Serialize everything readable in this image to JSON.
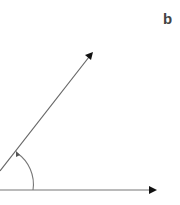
{
  "panel_label": "b",
  "diagram": {
    "type": "angle",
    "vertex": [
      -5,
      190
    ],
    "rays": [
      {
        "name": "horizontal-ray",
        "end": [
          157,
          190
        ],
        "arrowhead": true
      },
      {
        "name": "diagonal-ray",
        "end": [
          93,
          52
        ],
        "arrowhead": true
      }
    ],
    "angle_arc": {
      "radius": 38,
      "direction": "counterclockwise",
      "arrowhead_at": "diagonal-ray"
    }
  },
  "colors": {
    "line": "#666666",
    "arrowhead": "#111111",
    "label": "#444444",
    "background": "#ffffff"
  }
}
